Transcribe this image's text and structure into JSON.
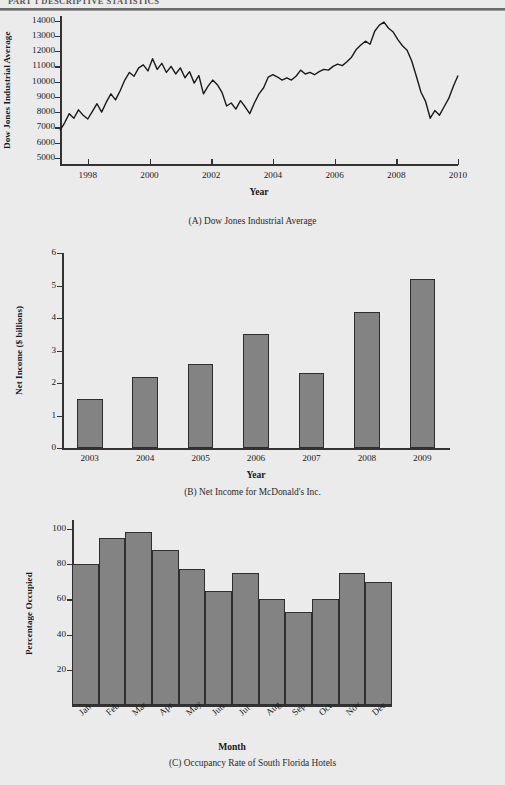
{
  "page": {
    "running_head": "PART 1  DESCRIPTIVE STATISTICS",
    "background_color": "#ebebeb",
    "bar_fill_color": "#838383",
    "bar_border_color": "#2e2e2e",
    "line_color": "#1a1a1a"
  },
  "figures": [
    {
      "id": "A",
      "caption": "(A) Dow Jones Industrial Average",
      "ylabel": "Dow Jones Industrial Average",
      "xlabel": "Year",
      "yticks": [
        "14000",
        "13000",
        "12000",
        "11000",
        "10000",
        "9000",
        "8000",
        "7000",
        "6000",
        "5000"
      ],
      "xticks": [
        "1998",
        "2000",
        "2002",
        "2004",
        "2006",
        "2008",
        "2010"
      ]
    },
    {
      "id": "B",
      "caption": "(B) Net Income for McDonald's Inc.",
      "ylabel": "Net Income ($ billions)",
      "xlabel": "Year",
      "yticks": [
        "6",
        "5",
        "4",
        "3",
        "2",
        "1",
        "0"
      ],
      "xticks": [
        "2003",
        "2004",
        "2005",
        "2006",
        "2007",
        "2008",
        "2009"
      ]
    },
    {
      "id": "C",
      "caption": "(C) Occupancy Rate of South Florida Hotels",
      "ylabel": "Percentage Occupied",
      "xlabel": "Month",
      "yticks": [
        "100",
        "80",
        "60",
        "40",
        "20"
      ],
      "xticks": [
        "Jan",
        "Feb",
        "Mar",
        "Apr",
        "May",
        "Jun",
        "Jul",
        "Aug",
        "Sep",
        "Oct",
        "Nov",
        "Dec"
      ]
    }
  ],
  "chart_data": [
    {
      "type": "line",
      "panel": "A",
      "title": "(A) Dow Jones Industrial Average",
      "xlabel": "Year",
      "ylabel": "Dow Jones Industrial Average",
      "xlim": [
        1997.1,
        2010.0
      ],
      "ylim": [
        4600,
        14300
      ],
      "ytick_values": [
        5000,
        6000,
        7000,
        8000,
        9000,
        10000,
        11000,
        12000,
        13000,
        14000
      ],
      "xtick_values": [
        1998,
        2000,
        2002,
        2004,
        2006,
        2008,
        2010
      ],
      "grid": false,
      "legend": "none",
      "x": [
        1997.1,
        1997.25,
        1997.4,
        1997.55,
        1997.7,
        1997.85,
        1998.0,
        1998.15,
        1998.3,
        1998.45,
        1998.6,
        1998.75,
        1998.9,
        1999.05,
        1999.2,
        1999.35,
        1999.5,
        1999.65,
        1999.8,
        1999.95,
        2000.1,
        2000.25,
        2000.4,
        2000.55,
        2000.7,
        2000.85,
        2001.0,
        2001.15,
        2001.3,
        2001.45,
        2001.6,
        2001.75,
        2001.9,
        2002.05,
        2002.2,
        2002.35,
        2002.5,
        2002.65,
        2002.8,
        2002.95,
        2003.1,
        2003.25,
        2003.4,
        2003.55,
        2003.7,
        2003.85,
        2004.0,
        2004.15,
        2004.3,
        2004.45,
        2004.6,
        2004.75,
        2004.9,
        2005.05,
        2005.2,
        2005.35,
        2005.5,
        2005.65,
        2005.8,
        2005.95,
        2006.1,
        2006.25,
        2006.4,
        2006.55,
        2006.7,
        2006.85,
        2007.0,
        2007.15,
        2007.3,
        2007.45,
        2007.6,
        2007.75,
        2007.9,
        2008.05,
        2008.2,
        2008.35,
        2008.5,
        2008.65,
        2008.8,
        2008.95,
        2009.1,
        2009.25,
        2009.4,
        2009.55,
        2009.7,
        2009.85,
        2010.0
      ],
      "y": [
        6800,
        7300,
        7900,
        7600,
        8150,
        7800,
        7550,
        8050,
        8550,
        8000,
        8650,
        9200,
        8800,
        9400,
        10100,
        10600,
        10350,
        10900,
        11100,
        10700,
        11500,
        10800,
        11200,
        10600,
        11000,
        10500,
        10900,
        10250,
        10650,
        9900,
        10400,
        9200,
        9700,
        10100,
        9800,
        9300,
        8400,
        8600,
        8200,
        8750,
        8350,
        7900,
        8600,
        9200,
        9600,
        10300,
        10450,
        10300,
        10100,
        10250,
        10100,
        10350,
        10750,
        10500,
        10600,
        10450,
        10650,
        10800,
        10750,
        11000,
        11150,
        11050,
        11300,
        11600,
        12100,
        12400,
        12650,
        12450,
        13300,
        13700,
        13900,
        13500,
        13250,
        12750,
        12350,
        12050,
        11350,
        10350,
        9300,
        8700,
        7600,
        8100,
        7800,
        8350,
        8900,
        9700,
        10400
      ]
    },
    {
      "type": "bar",
      "panel": "B",
      "title": "(B) Net Income for McDonald's Inc.",
      "xlabel": "Year",
      "ylabel": "Net Income ($ billions)",
      "categories": [
        "2003",
        "2004",
        "2005",
        "2006",
        "2007",
        "2008",
        "2009"
      ],
      "values": [
        1.5,
        2.2,
        2.6,
        3.5,
        2.3,
        4.2,
        5.2
      ],
      "ylim": [
        0,
        6
      ],
      "ytick_values": [
        0,
        1,
        2,
        3,
        4,
        5,
        6
      ],
      "grid": false,
      "legend": "none"
    },
    {
      "type": "bar",
      "panel": "C",
      "title": "(C) Occupancy Rate of South Florida Hotels",
      "xlabel": "Month",
      "ylabel": "Percentage Occupied",
      "categories": [
        "Jan",
        "Feb",
        "Mar",
        "Apr",
        "May",
        "Jun",
        "Jul",
        "Aug",
        "Sep",
        "Oct",
        "Nov",
        "Dec"
      ],
      "values": [
        80,
        95,
        98,
        88,
        77,
        65,
        75,
        60,
        53,
        60,
        75,
        70
      ],
      "ylim": [
        0,
        105
      ],
      "ytick_values": [
        20,
        40,
        60,
        80,
        100
      ],
      "grid": false,
      "legend": "none",
      "bars_adjacent": true
    }
  ]
}
